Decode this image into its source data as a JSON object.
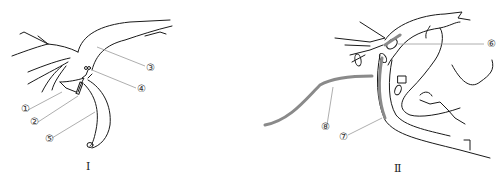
{
  "figure": {
    "panels": [
      {
        "id": "I",
        "label": "Ⅰ"
      },
      {
        "id": "II",
        "label": "Ⅱ"
      }
    ],
    "callouts": {
      "c1": "①",
      "c2": "②",
      "c3": "③",
      "c4": "④",
      "c5": "⑤",
      "c6": "⑥",
      "c7": "⑦",
      "c8": "⑧"
    },
    "colors": {
      "line": "#1a1a1a",
      "leader": "#999999",
      "tube": "#8a8a8a"
    }
  }
}
